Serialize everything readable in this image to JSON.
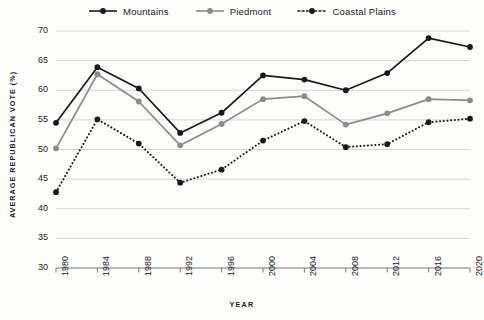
{
  "chart_data": {
    "type": "line",
    "title": "",
    "xlabel": "YEAR",
    "ylabel": "AVERAGE REPUBLICAN VOTE (%)",
    "categories": [
      "1980",
      "1984",
      "1988",
      "1992",
      "1996",
      "2000",
      "2004",
      "2008",
      "2012",
      "2016",
      "2020"
    ],
    "x": [
      1980,
      1984,
      1988,
      1992,
      1996,
      2000,
      2004,
      2008,
      2012,
      2016,
      2020
    ],
    "ylim": [
      30,
      70
    ],
    "xlim": [
      1980,
      2020
    ],
    "yticks": [
      30,
      35,
      40,
      45,
      50,
      55,
      60,
      65,
      70
    ],
    "grid": true,
    "legend_position": "top-center",
    "series": [
      {
        "name": "Mountains",
        "color": "#1a1a1a",
        "style": "solid",
        "values": [
          54.5,
          63.9,
          60.3,
          52.8,
          56.2,
          62.5,
          61.8,
          60.0,
          62.9,
          68.8,
          67.3
        ]
      },
      {
        "name": "Piedmont",
        "color": "#8c8c8c",
        "style": "solid",
        "values": [
          50.2,
          62.7,
          58.1,
          50.7,
          54.3,
          58.5,
          59.0,
          54.2,
          56.1,
          58.5,
          58.3
        ]
      },
      {
        "name": "Coastal Plains",
        "color": "#1a1a1a",
        "style": "dotted",
        "values": [
          42.8,
          55.1,
          51.0,
          44.4,
          46.6,
          51.5,
          54.8,
          50.4,
          50.9,
          54.6,
          55.2
        ]
      }
    ]
  }
}
